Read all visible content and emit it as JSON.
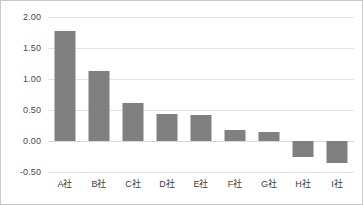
{
  "chart_data": {
    "type": "bar",
    "title": "",
    "subtitle": "",
    "xlabel": "",
    "ylabel": "",
    "categories": [
      "A社",
      "B社",
      "C社",
      "D社",
      "E社",
      "F社",
      "G社",
      "H社",
      "I社"
    ],
    "values": [
      1.77,
      1.13,
      0.6,
      0.43,
      0.42,
      0.18,
      0.14,
      -0.27,
      -0.36
    ],
    "series": [
      {
        "name": "",
        "values": [
          1.77,
          1.13,
          0.6,
          0.43,
          0.42,
          0.18,
          0.14,
          -0.27,
          -0.36
        ]
      }
    ],
    "ylim": [
      -0.5,
      2.0
    ],
    "ytick_values": [
      2.0,
      1.5,
      1.0,
      0.5,
      0.0,
      -0.5
    ],
    "ytick_labels": [
      "2.00",
      "1.50",
      "1.00",
      "0.50",
      "0.00",
      "-0.50"
    ],
    "grid": true,
    "grid_axis": "y",
    "legend": false,
    "legend_position": "none",
    "annotations": [],
    "bar_color": "#808080",
    "gridline_color": "#e3e3e3",
    "frame_color": "#c8c8c8",
    "axis_text_color": "#4a4a4a"
  }
}
